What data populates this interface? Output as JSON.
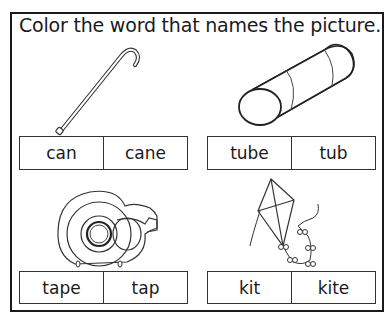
{
  "worksheet": {
    "instruction": "Color the word that names the picture.",
    "items": [
      {
        "picture": "cane-icon",
        "choices": [
          "can",
          "cane"
        ]
      },
      {
        "picture": "tube-icon",
        "choices": [
          "tube",
          "tub"
        ]
      },
      {
        "picture": "tape-dispenser-icon",
        "choices": [
          "tape",
          "tap"
        ]
      },
      {
        "picture": "kite-icon",
        "choices": [
          "kit",
          "kite"
        ]
      }
    ]
  }
}
